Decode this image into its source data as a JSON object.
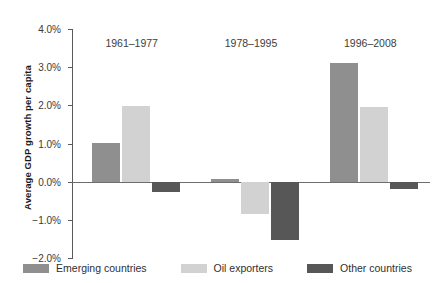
{
  "chart_data": {
    "type": "bar",
    "title": "",
    "subtitle": "",
    "xlabel": "",
    "ylabel": "Average GDP growth per capita",
    "categories": [
      "1961–1977",
      "1978–1995",
      "1996–2008"
    ],
    "series": [
      {
        "name": "Emerging countries",
        "color": "#8f8f8f",
        "values": [
          1.02,
          0.08,
          3.1
        ]
      },
      {
        "name": "Oil exporters",
        "color": "#d2d2d2",
        "values": [
          1.98,
          -0.84,
          1.95
        ]
      },
      {
        "name": "Other countries",
        "color": "#575757",
        "values": [
          -0.26,
          -1.52,
          -0.18
        ]
      }
    ],
    "ylim": [
      -2.0,
      4.0
    ],
    "yticks": [
      4.0,
      3.0,
      2.0,
      1.0,
      0.0,
      -1.0,
      -2.0
    ],
    "ytick_labels": [
      "4.0%",
      "3.0%",
      "2.0%",
      "1.0%",
      "0.0%",
      "−1.0%",
      "−2.0%"
    ],
    "value_suffix": "%",
    "grid": false,
    "legend_position": "bottom",
    "zero_line": true
  },
  "legend": {
    "items": [
      {
        "label": "Emerging countries",
        "color": "#8f8f8f"
      },
      {
        "label": "Oil exporters",
        "color": "#d2d2d2"
      },
      {
        "label": "Other countries",
        "color": "#575757"
      }
    ]
  },
  "axis": {
    "y_title": "Average GDP growth per capita"
  }
}
